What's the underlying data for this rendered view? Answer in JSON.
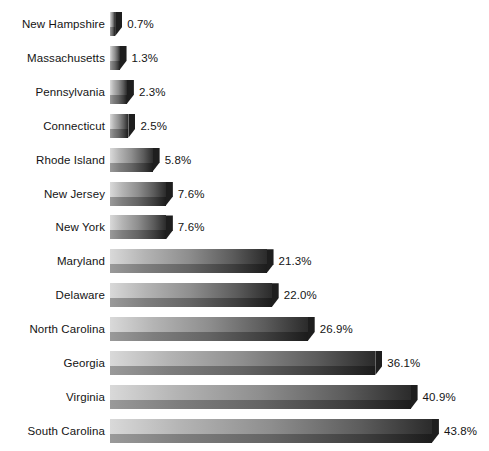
{
  "chart_data": {
    "type": "bar",
    "orientation": "horizontal",
    "title": "",
    "subtitle": "",
    "xlabel": "",
    "ylabel": "",
    "grid": false,
    "legend": null,
    "axis_visible": false,
    "tick_labels": [],
    "xlim": [
      0,
      43.8
    ],
    "value_suffix": "%",
    "categories": [
      "New Hampshire",
      "Massachusetts",
      "Pennsylvania",
      "Connecticut",
      "Rhode Island",
      "New Jersey",
      "New York",
      "Maryland",
      "Delaware",
      "North Carolina",
      "Georgia",
      "Virginia",
      "South Carolina"
    ],
    "values": [
      0.7,
      1.3,
      2.3,
      2.5,
      5.8,
      7.6,
      7.6,
      21.3,
      22.0,
      26.9,
      36.1,
      40.9,
      43.8
    ],
    "value_labels": [
      "0.7%",
      "1.3%",
      "2.3%",
      "2.5%",
      "5.8%",
      "7.6%",
      "7.6%",
      "21.3%",
      "22.0%",
      "26.9%",
      "36.1%",
      "40.9%",
      "43.8%"
    ],
    "colors": {
      "bar_gradient_light": "#d9d9d9",
      "bar_gradient_dark": "#2b2b2b",
      "bar_shadow_face": "#1c1c1c",
      "text": "#141414",
      "background": "#ffffff"
    }
  },
  "layout": {
    "bar_origin_x": 110,
    "px_per_percent": 7.35,
    "row_pitch": 33.9,
    "first_row_top": 12,
    "bar_height": 24
  }
}
